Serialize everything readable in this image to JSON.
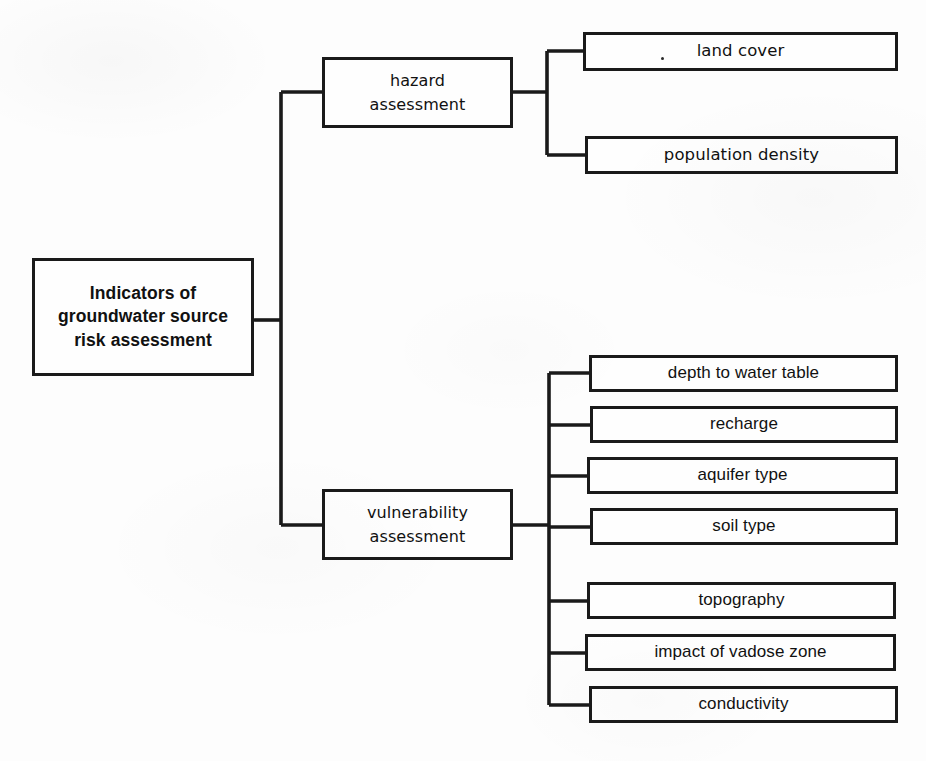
{
  "diagram": {
    "type": "hierarchical-tree",
    "title": "Indicators of groundwater source risk assessment",
    "orientation": "left-to-right",
    "colors": {
      "background": "#fdfdfd",
      "box_fill": "#fefefe",
      "stroke": "#1a1a1a",
      "text": "#111111"
    },
    "root": {
      "label": "Indicators of\ngroundwater  source\nrisk assessment"
    },
    "branches": [
      {
        "id": "hazard",
        "label": "hazard\nassessment",
        "children": [
          {
            "id": "land-cover",
            "label": "land cover",
            "has_stray_dot": true
          },
          {
            "id": "population-density",
            "label": "population density",
            "has_stray_dot": false
          }
        ]
      },
      {
        "id": "vulnerability",
        "label": "vulnerability\nassessment",
        "children": [
          {
            "id": "depth-to-water-table",
            "label": "depth to water table"
          },
          {
            "id": "recharge",
            "label": "recharge"
          },
          {
            "id": "aquifer-type",
            "label": "aquifer type"
          },
          {
            "id": "soil-type",
            "label": "soil type"
          },
          {
            "id": "topography",
            "label": "topography"
          },
          {
            "id": "impact-of-vadose-zone",
            "label": "impact of vadose zone"
          },
          {
            "id": "conductivity",
            "label": "conductivity"
          }
        ]
      }
    ]
  }
}
